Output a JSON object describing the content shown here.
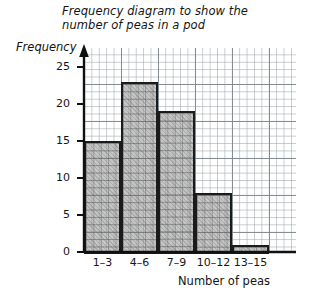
{
  "chart_data": {
    "type": "bar",
    "title": "Frequency diagram to show the number of peas in a pod",
    "title_line1": "Frequency diagram to show the",
    "title_line2": "number of peas in a pod",
    "xlabel": "Number of peas",
    "ylabel": "Frequency",
    "categories": [
      "1–3",
      "4–6",
      "7–9",
      "10–12",
      "13–15"
    ],
    "values": [
      15,
      23,
      19,
      8,
      1
    ],
    "ylim": [
      0,
      27
    ],
    "yticks": [
      0,
      5,
      10,
      15,
      20,
      25
    ],
    "ytick_labels": [
      "0",
      "5",
      "10",
      "15",
      "20",
      "25"
    ],
    "grid": true,
    "grid_style": "graph-paper",
    "legend": null,
    "bar_fill_color": "#969696",
    "bar_edge_color": "#1b1b1b",
    "axis_color": "#101010",
    "grid_color": "#7a8287"
  }
}
